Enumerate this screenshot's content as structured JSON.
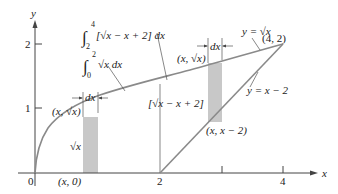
{
  "diagram": {
    "type": "area-between-curves",
    "axes": {
      "x_label": "x",
      "y_label": "y",
      "x_ticks": [
        {
          "value": 0,
          "label": "0"
        },
        {
          "value": 2,
          "label": "2"
        },
        {
          "value": 3,
          "label": ""
        },
        {
          "value": 4,
          "label": "4"
        }
      ],
      "y_ticks": [
        {
          "value": 1,
          "label": "1"
        },
        {
          "value": 2,
          "label": "2"
        }
      ]
    },
    "curves": [
      {
        "name": "y = √x",
        "label": "y = √x"
      },
      {
        "name": "y = x − 2",
        "label": "y = x − 2"
      }
    ],
    "labels": {
      "integral_top": {
        "lower": "2",
        "upper": "4",
        "body": "[√x − x + 2] dx"
      },
      "integral_bottom": {
        "lower": "0",
        "upper": "2",
        "body": "√x dx"
      },
      "point_intersection": "(4, 2)",
      "point_left_top": "(x, √x)",
      "point_right_top": "(x, √x)",
      "point_right_bottom": "(x, x − 2)",
      "point_left_bottom": "(x, 0)",
      "left_height": "√x",
      "right_height": "[√x − x + 2]",
      "dx_left": "dx",
      "dx_right": "dx",
      "origin": "0",
      "x_two": "2",
      "x_four": "4",
      "y_one": "1",
      "y_two": "2",
      "x_axis": "x",
      "y_axis": "y",
      "sqrt_x": "√x",
      "x_minus_2": "y = x − 2",
      "y_sqrt": "y = √x"
    }
  }
}
